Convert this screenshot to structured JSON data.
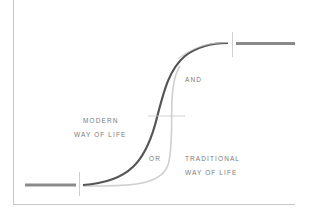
{
  "diagram": {
    "labels": {
      "modern_line1": "MODERN",
      "modern_line2": "WAY OF LIFE",
      "and": "AND",
      "or": "OR",
      "traditional_line1": "TRADITIONAL",
      "traditional_line2": "WAY OF LIFE"
    },
    "colors": {
      "dark_curve": "#555555",
      "light_curve": "#cfcfcf",
      "bars": "#8a8a8a",
      "ticks": "#bdbdbd",
      "frame": "#c8c8c8",
      "text": "#7a7a7a"
    },
    "elements": [
      {
        "name": "start-bar",
        "description": "thick horizontal line at lower left"
      },
      {
        "name": "modern-curve",
        "description": "dark S-curve rising gradually"
      },
      {
        "name": "traditional-curve",
        "description": "light curve staying flat then rising sharply"
      },
      {
        "name": "end-bar",
        "description": "thick horizontal line at upper right"
      }
    ]
  }
}
